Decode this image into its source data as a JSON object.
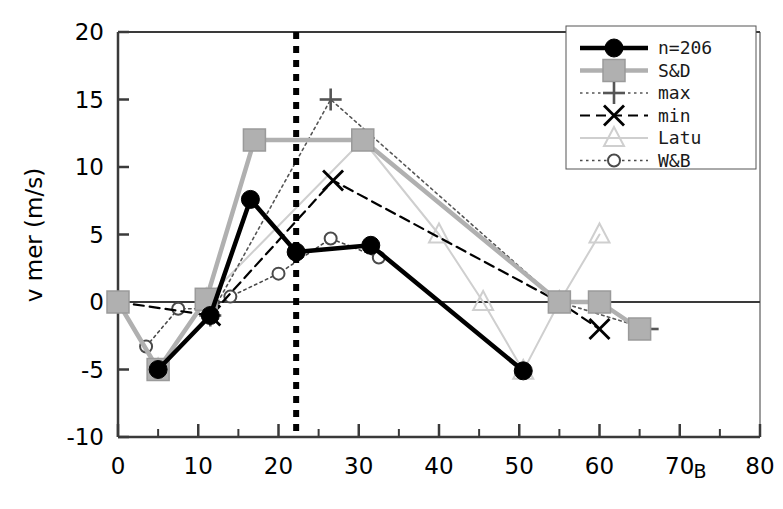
{
  "chart_data": {
    "type": "line",
    "title": "",
    "xlabel": "B",
    "ylabel": "v mer (m/s)",
    "xlim": [
      0,
      80
    ],
    "ylim": [
      -10,
      20
    ],
    "x_ticks": [
      0,
      10,
      20,
      30,
      40,
      50,
      60,
      70,
      80
    ],
    "x_tick_labels": [
      "0",
      "10",
      "20",
      "30",
      "40",
      "50",
      "60",
      "70",
      "80"
    ],
    "x_minor_ticks": [
      5,
      15,
      25,
      35,
      45,
      55,
      65,
      75
    ],
    "y_ticks": [
      -10,
      -5,
      0,
      5,
      10,
      15,
      20
    ],
    "y_tick_labels": [
      "-10",
      "-5",
      "0",
      "5",
      "10",
      "15",
      "20"
    ],
    "grid": false,
    "legend_position": "top-right",
    "annotations": [
      {
        "name": "vertical-reference-line",
        "type": "vline",
        "x": 22.2,
        "style": "dotted-thick-black"
      },
      {
        "name": "zero-horizontal-line",
        "type": "hline",
        "y": 0,
        "style": "solid-gray"
      }
    ],
    "series": [
      {
        "name": "n=206",
        "line": "solid-thick",
        "color": "#000000",
        "marker": "filled-circle",
        "points": [
          [
            5,
            -5
          ],
          [
            11.5,
            -1
          ],
          [
            16.5,
            7.6
          ],
          [
            22.2,
            3.7
          ],
          [
            31.5,
            4.2
          ],
          [
            50.5,
            -5.1
          ]
        ]
      },
      {
        "name": "S&D",
        "line": "solid-thick",
        "color": "#b0b0b0",
        "marker": "filled-square",
        "points": [
          [
            0,
            0
          ],
          [
            5,
            -5
          ],
          [
            11,
            0.2
          ],
          [
            17,
            12
          ],
          [
            30.5,
            12
          ],
          [
            55,
            0
          ],
          [
            60,
            0
          ],
          [
            65,
            -2
          ]
        ]
      },
      {
        "name": "max",
        "line": "dotted",
        "color": "#555555",
        "marker": "plus",
        "points": [
          [
            5,
            -5
          ],
          [
            11.5,
            -1
          ],
          [
            26.5,
            15
          ],
          [
            55,
            0
          ],
          [
            66,
            -2
          ]
        ]
      },
      {
        "name": "min",
        "line": "dashed",
        "color": "#000000",
        "marker": "cross",
        "points": [
          [
            0,
            0
          ],
          [
            11.5,
            -1
          ],
          [
            26.8,
            9
          ],
          [
            55,
            0
          ],
          [
            60,
            -2
          ]
        ]
      },
      {
        "name": "Latu",
        "line": "solid-thin",
        "color": "#cfcfcf",
        "marker": "open-triangle",
        "points": [
          [
            5,
            -5
          ],
          [
            11,
            0.2
          ],
          [
            30.5,
            12
          ],
          [
            40,
            5
          ],
          [
            45.5,
            0
          ],
          [
            50.5,
            -5.1
          ],
          [
            55,
            0
          ],
          [
            60,
            5
          ]
        ]
      },
      {
        "name": "W&B",
        "line": "dotted",
        "color": "#4a4a4a",
        "marker": "open-circle",
        "points": [
          [
            3.5,
            -3.3
          ],
          [
            7.5,
            -0.5
          ],
          [
            11.5,
            -0.5
          ],
          [
            14,
            0.4
          ],
          [
            20,
            2.1
          ],
          [
            26.5,
            4.7
          ],
          [
            32.5,
            3.3
          ]
        ]
      }
    ]
  },
  "legend": {
    "items": [
      {
        "label": "n=206",
        "marker": "filled-circle",
        "line": "solid-thick",
        "color": "#000000"
      },
      {
        "label": "S&D",
        "marker": "filled-square",
        "line": "solid-thick",
        "color": "#b0b0b0"
      },
      {
        "label": "max",
        "marker": "plus",
        "line": "dotted",
        "color": "#555555"
      },
      {
        "label": "min",
        "marker": "cross",
        "line": "dashed",
        "color": "#000000"
      },
      {
        "label": "Latu",
        "marker": "open-triangle",
        "line": "solid-thin",
        "color": "#cfcfcf"
      },
      {
        "label": "W&B",
        "marker": "open-circle",
        "line": "dotted",
        "color": "#4a4a4a"
      }
    ]
  },
  "axes": {
    "y_title": "v mer (m/s)",
    "x_title": "B"
  }
}
